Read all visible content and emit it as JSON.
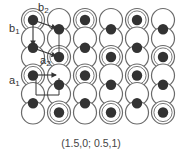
{
  "labels": {
    "a1": {
      "base": "a",
      "sub": "1"
    },
    "a2": {
      "base": "a",
      "sub": "2"
    },
    "b1": {
      "base": "b",
      "sub": "1"
    },
    "b2": {
      "base": "b",
      "sub": "2"
    }
  },
  "caption": "(1.5,0; 0.5,1)",
  "lattice": {
    "columns_x": [
      33,
      59,
      85,
      111,
      137,
      163
    ],
    "circle_rows_y": [
      20,
      38.5,
      57,
      75.5,
      94,
      112.5
    ],
    "circle_radius": 11.5,
    "column_types": [
      "A",
      "B",
      "A",
      "B",
      "A",
      "B"
    ],
    "type_A": {
      "dot_y": [
        20,
        47.7,
        75.5,
        103.2
      ],
      "double_ring_rows": [
        0,
        3
      ]
    },
    "type_B": {
      "dot_y": [
        29.2,
        57,
        84.7,
        112.5
      ],
      "double_ring_rows": [
        2,
        5
      ]
    }
  },
  "colors": {
    "ring": "#6a6a6a",
    "dot": "#333333",
    "arrow": "#333333"
  }
}
